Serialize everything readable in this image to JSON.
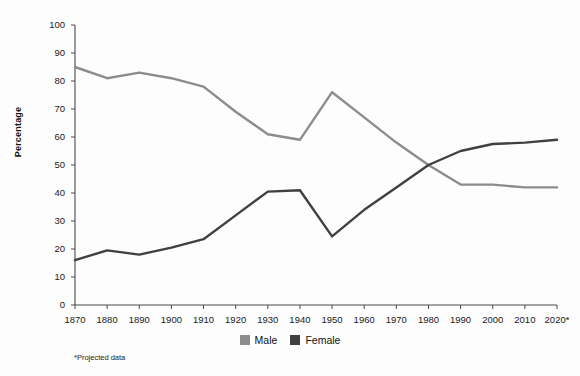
{
  "chart_data": {
    "type": "line",
    "title": "",
    "xlabel": "",
    "ylabel": "Percentage",
    "ylim": [
      0,
      100
    ],
    "ytick_step": 10,
    "grid": false,
    "legend_position": "bottom-center",
    "footnote": "*Projected data",
    "categories": [
      "1870",
      "1880",
      "1890",
      "1900",
      "1910",
      "1920",
      "1930",
      "1940",
      "1950",
      "1960",
      "1970",
      "1980",
      "1990",
      "2000",
      "2010",
      "2020*"
    ],
    "yticks": [
      "0",
      "10",
      "20",
      "30",
      "40",
      "50",
      "60",
      "70",
      "80",
      "90",
      "100"
    ],
    "series": [
      {
        "name": "Male",
        "color": "#8c8c8c",
        "values": [
          85,
          81,
          83,
          81,
          78,
          69,
          61,
          59,
          76,
          67,
          58,
          50,
          43,
          43,
          42,
          42
        ]
      },
      {
        "name": "Female",
        "color": "#404040",
        "values": [
          16,
          19.5,
          18,
          20.5,
          23.5,
          32,
          40.5,
          41,
          24.5,
          34,
          42,
          50,
          55,
          57.5,
          58,
          59
        ]
      }
    ]
  }
}
